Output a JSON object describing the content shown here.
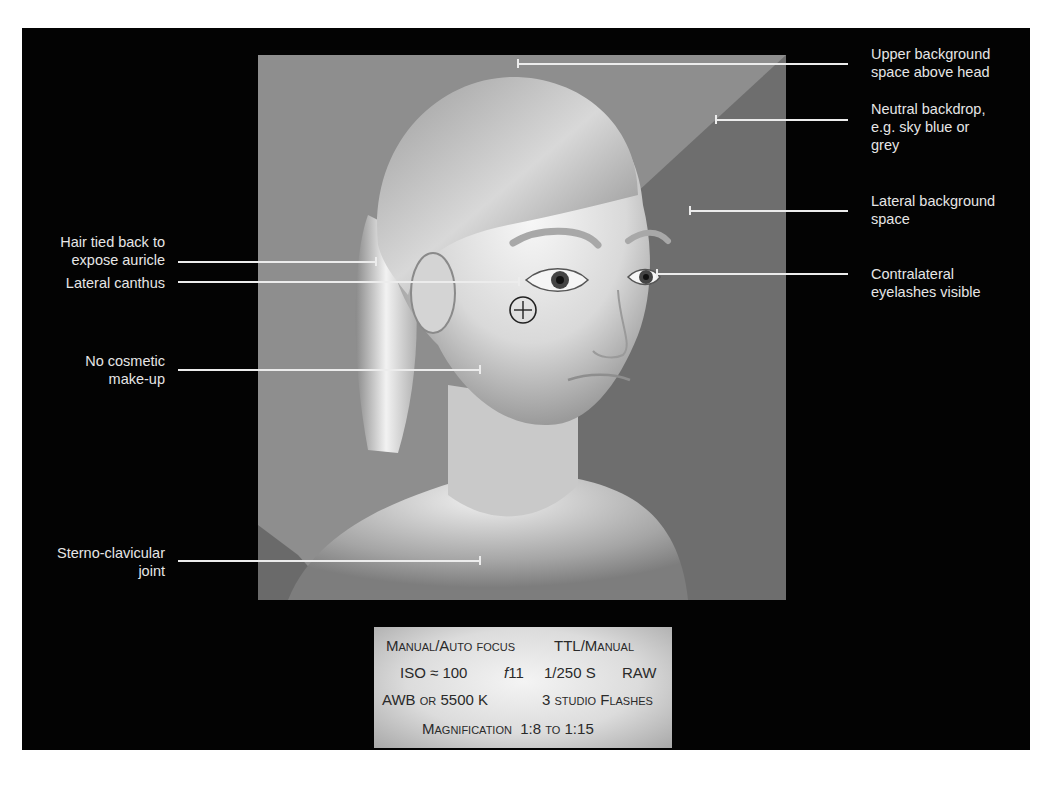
{
  "figure": {
    "background_frame_color": "#030303",
    "panel_backdrop_color": "#8a8a8a",
    "panel_shadow_color": "#6f6f6f"
  },
  "annotations": {
    "right": [
      {
        "id": "upper-background",
        "lines": [
          "Upper background",
          "space above head"
        ]
      },
      {
        "id": "neutral-backdrop",
        "lines": [
          "Neutral backdrop,",
          "e.g. sky blue or",
          "grey"
        ]
      },
      {
        "id": "lateral-background",
        "lines": [
          "Lateral background",
          "space"
        ]
      },
      {
        "id": "contralateral-eyelashes",
        "lines": [
          "Contralateral",
          "eyelashes visible"
        ]
      }
    ],
    "left": [
      {
        "id": "hair-tied-back",
        "lines": [
          "Hair tied back to",
          "expose auricle"
        ]
      },
      {
        "id": "lateral-canthus",
        "lines": [
          "Lateral canthus"
        ]
      },
      {
        "id": "no-makeup",
        "lines": [
          "No cosmetic",
          "make-up"
        ]
      },
      {
        "id": "sterno-clavicular",
        "lines": [
          "Sterno-clavicular",
          "joint"
        ]
      }
    ]
  },
  "camera_settings": {
    "row1": {
      "focus": "Manual/Auto focus",
      "flash_mode": "TTL/Manual"
    },
    "row2": {
      "iso": "ISO ≈ 100",
      "aperture_f": "f",
      "aperture_val": "11",
      "shutter": "1/250 S",
      "format": "RAW"
    },
    "row3": {
      "wb": "AWB",
      "wb_or": "or",
      "wb_temp": "5500 K",
      "flashes": "3 studio Flashes"
    },
    "row4": {
      "mag_label": "Magnification",
      "mag_from": "1:8",
      "mag_to_word": "to",
      "mag_to": "1:15"
    }
  },
  "crosshair": {
    "symbol": "focus-point"
  },
  "caption_fragment": "... Mann (P. Di...) ... reading"
}
